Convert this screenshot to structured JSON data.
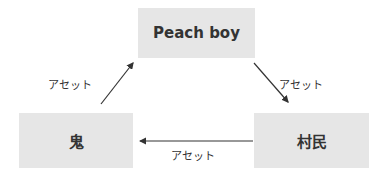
{
  "diagram": {
    "nodes": [
      {
        "id": "peach_boy",
        "label": "Peach boy"
      },
      {
        "id": "oni",
        "label": "鬼"
      },
      {
        "id": "villagers",
        "label": "村民"
      }
    ],
    "edges": [
      {
        "from": "oni",
        "to": "peach_boy",
        "label": "アセット"
      },
      {
        "from": "peach_boy",
        "to": "villagers",
        "label": "アセット"
      },
      {
        "from": "villagers",
        "to": "oni",
        "label": "アセット"
      }
    ],
    "colors": {
      "node_fill": "#e6e6e6",
      "text": "#333333",
      "arrow": "#333333"
    }
  }
}
